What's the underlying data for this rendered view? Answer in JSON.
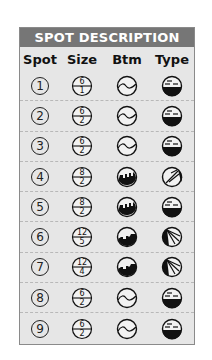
{
  "header": {
    "title": "SPOT DESCRIPTION"
  },
  "columns": [
    "Spot",
    "Size",
    "Btm",
    "Type"
  ],
  "colors": {
    "header_bg": "#767676",
    "card_bg": "#e6e6e6",
    "ink": "#111111"
  },
  "rows": [
    {
      "spot": "1",
      "size_top": "6",
      "size_bottom": "1",
      "bottom": "wave",
      "type": "half-filled-lines"
    },
    {
      "spot": "2",
      "size_top": "6",
      "size_bottom": "2",
      "bottom": "wave",
      "type": "half-filled-lines"
    },
    {
      "spot": "3",
      "size_top": "6",
      "size_bottom": "2",
      "bottom": "wave",
      "type": "half-filled-lines"
    },
    {
      "spot": "4",
      "size_top": "8",
      "size_bottom": "2",
      "bottom": "rocky",
      "type": "diagonal-rays"
    },
    {
      "spot": "5",
      "size_top": "8",
      "size_bottom": "2",
      "bottom": "rocky",
      "type": "half-filled-lines"
    },
    {
      "spot": "6",
      "size_top": "12",
      "size_bottom": "5",
      "bottom": "rocky-ledge",
      "type": "side-rays"
    },
    {
      "spot": "7",
      "size_top": "12",
      "size_bottom": "4",
      "bottom": "rocky-ledge",
      "type": "side-rays"
    },
    {
      "spot": "8",
      "size_top": "6",
      "size_bottom": "2",
      "bottom": "wave",
      "type": "half-filled-lines"
    },
    {
      "spot": "9",
      "size_top": "6",
      "size_bottom": "2",
      "bottom": "wave",
      "type": "half-filled-lines"
    }
  ]
}
